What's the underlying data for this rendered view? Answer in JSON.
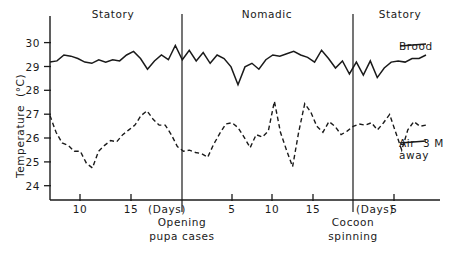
{
  "figure": {
    "background": "#ffffff",
    "ink_color": "#1a1a1a",
    "axis_title_y": "Temperature  (°C)"
  },
  "chart_data": {
    "type": "line",
    "title": "",
    "xlabel": "(Days)",
    "ylabel": "Temperature  (°C)",
    "ylim": [
      23.2,
      30.6
    ],
    "yticks": [
      24,
      25,
      26,
      27,
      28,
      29,
      30
    ],
    "ytick_labels": [
      "24",
      "25",
      "26",
      "27",
      "28",
      "29",
      "30"
    ],
    "grid": false,
    "legend_position": "right-inline",
    "x_axis_note": "Day counter restarts at each phase boundary; ticks labelled within each phase segment",
    "xticks": [
      {
        "px": 80,
        "label": "10"
      },
      {
        "px": 131,
        "label": "15"
      },
      {
        "px": 232,
        "label": "5"
      },
      {
        "px": 272,
        "label": "10"
      },
      {
        "px": 313,
        "label": "15"
      },
      {
        "px": 394,
        "label": "5"
      }
    ],
    "phases": [
      {
        "name": "Statory",
        "center_px": 113,
        "start_px": 50,
        "end_px": 182
      },
      {
        "name": "Nomadic",
        "center_px": 267,
        "start_px": 182,
        "end_px": 353
      },
      {
        "name": "Statory",
        "center_px": 400,
        "start_px": 353,
        "end_px": 440
      }
    ],
    "dividers": [
      {
        "px": 182,
        "label_line1": "Opening",
        "label_line2": "pupa cases"
      },
      {
        "px": 353,
        "label_line1": "Cocoon",
        "label_line2": "spinning"
      }
    ],
    "series": [
      {
        "name": "Brood",
        "style": "solid",
        "label_x_px": 404,
        "label_y_px": 46,
        "values": [
          29.25,
          29.3,
          29.55,
          29.5,
          29.4,
          29.25,
          29.2,
          29.35,
          29.25,
          29.35,
          29.3,
          29.55,
          29.7,
          29.4,
          28.95,
          29.3,
          29.55,
          29.35,
          29.95,
          29.35,
          29.75,
          29.3,
          29.65,
          29.2,
          29.55,
          29.4,
          29.05,
          28.3,
          29.05,
          29.2,
          28.95,
          29.35,
          29.55,
          29.5,
          29.6,
          29.7,
          29.55,
          29.45,
          29.25,
          29.75,
          29.4,
          29.0,
          29.3,
          28.75,
          29.25,
          28.7,
          29.3,
          28.6,
          29.0,
          29.25,
          29.3,
          29.25,
          29.4,
          29.4,
          29.55
        ]
      },
      {
        "name": "Air 3 M away",
        "style": "dashed",
        "label_x_px": 404,
        "label_y_px": 143,
        "values": [
          27.0,
          26.3,
          25.85,
          25.75,
          25.5,
          25.5,
          25.0,
          24.8,
          25.5,
          25.75,
          25.95,
          25.9,
          26.2,
          26.4,
          26.6,
          27.0,
          27.2,
          26.85,
          26.6,
          26.6,
          26.2,
          25.7,
          25.5,
          25.55,
          25.45,
          25.4,
          25.25,
          25.8,
          26.25,
          26.65,
          26.7,
          26.5,
          26.1,
          25.65,
          26.2,
          26.1,
          26.35,
          27.6,
          26.3,
          25.55,
          24.85,
          26.3,
          27.5,
          27.15,
          26.55,
          26.3,
          26.75,
          26.55,
          26.2,
          26.35,
          26.55,
          26.65,
          26.6,
          26.7,
          26.4,
          26.7,
          27.05,
          26.3,
          25.55,
          26.4,
          26.75,
          26.55,
          26.6
        ]
      }
    ]
  },
  "labels": {
    "phase_statory_left": "Statory",
    "phase_nomadic": "Nomadic",
    "phase_statory_right": "Statory",
    "divider1_line1": "Opening",
    "divider1_line2": "pupa cases",
    "divider2_line1": "Cocoon",
    "divider2_line2": "spinning",
    "series_brood": "Brood",
    "series_air_line1": "Air  3 M",
    "series_air_line2": "away",
    "days_mid": "(Days)",
    "days_right": "(Days)",
    "ytick_24": "24",
    "ytick_25": "25",
    "ytick_26": "26",
    "ytick_27": "27",
    "ytick_28": "28",
    "ytick_29": "29",
    "ytick_30": "30",
    "xtick_10a": "10",
    "xtick_15a": "15",
    "xtick_5b": "5",
    "xtick_10b": "10",
    "xtick_15b": "15",
    "xtick_5c": "5"
  }
}
